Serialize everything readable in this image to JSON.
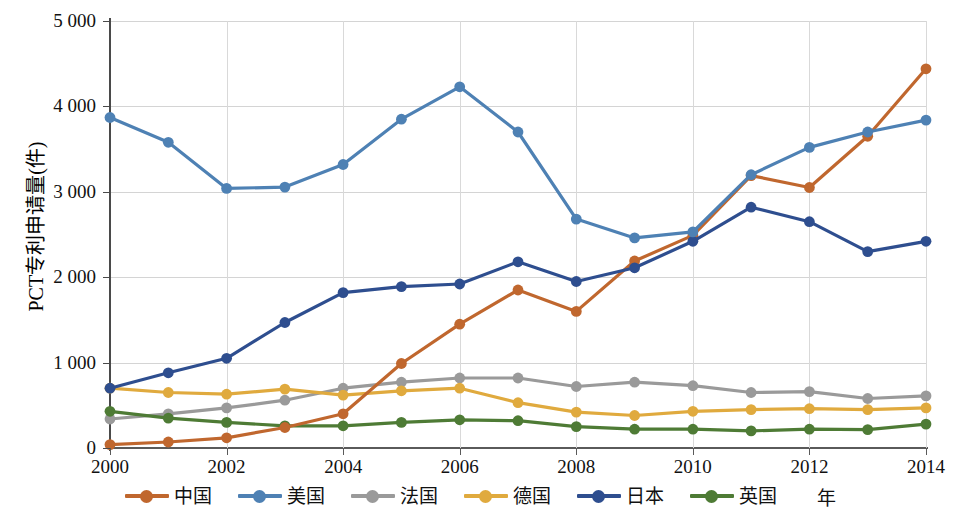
{
  "chart_data": {
    "type": "line",
    "title": "",
    "xlabel": "年",
    "ylabel": "PCT专利申请量(件)",
    "xlim": [
      2000,
      2014
    ],
    "ylim": [
      0,
      5000
    ],
    "grid": true,
    "legend_position": "bottom",
    "x": [
      2000,
      2001,
      2002,
      2003,
      2004,
      2005,
      2006,
      2007,
      2008,
      2009,
      2010,
      2011,
      2012,
      2013,
      2014
    ],
    "xticks": [
      "2000",
      "2002",
      "2004",
      "2006",
      "2008",
      "2010",
      "2012",
      "2014"
    ],
    "yticks": [
      "0",
      "1 000",
      "2 000",
      "3 000",
      "4 000",
      "5 000"
    ],
    "ytick_values": [
      0,
      1000,
      2000,
      3000,
      4000,
      5000
    ],
    "series": [
      {
        "name": "中国",
        "color": "#C0672E",
        "values": [
          40,
          70,
          120,
          240,
          400,
          990,
          1450,
          1850,
          1600,
          2190,
          2490,
          3190,
          3050,
          3650,
          4440
        ]
      },
      {
        "name": "美国",
        "color": "#4E81B4",
        "values": [
          3870,
          3580,
          3040,
          3055,
          3320,
          3850,
          4230,
          3700,
          2680,
          2460,
          2530,
          3200,
          3520,
          3700,
          3840
        ]
      },
      {
        "name": "法国",
        "color": "#9A9A9A",
        "values": [
          340,
          400,
          470,
          560,
          700,
          770,
          820,
          820,
          720,
          770,
          730,
          650,
          660,
          580,
          610
        ]
      },
      {
        "name": "德国",
        "color": "#E0AA3E",
        "values": [
          700,
          650,
          630,
          690,
          620,
          670,
          700,
          530,
          420,
          380,
          430,
          450,
          460,
          450,
          470
        ]
      },
      {
        "name": "日本",
        "color": "#2E4E8F",
        "values": [
          700,
          880,
          1050,
          1470,
          1820,
          1890,
          1920,
          2180,
          1950,
          2110,
          2420,
          2820,
          2650,
          2300,
          2420
        ]
      },
      {
        "name": "英国",
        "color": "#4E7B35",
        "values": [
          430,
          350,
          300,
          260,
          260,
          300,
          330,
          320,
          250,
          220,
          220,
          200,
          220,
          215,
          280
        ]
      }
    ]
  },
  "legend": {
    "items": [
      {
        "label": "中国"
      },
      {
        "label": "美国"
      },
      {
        "label": "法国"
      },
      {
        "label": "德国"
      },
      {
        "label": "日本"
      },
      {
        "label": "英国"
      }
    ],
    "axis_unit_label": "年"
  }
}
